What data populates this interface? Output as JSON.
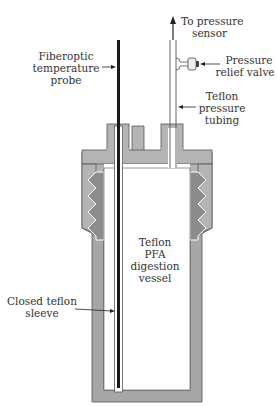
{
  "diagram": {
    "labels": {
      "to_pressure_sensor": [
        "To pressure",
        "sensor"
      ],
      "fiberoptic_probe": [
        "Fiberoptic",
        "temperature",
        "probe"
      ],
      "pressure_relief_valve": [
        "Pressure",
        "relief valve"
      ],
      "teflon_tubing": [
        "Teflon",
        "pressure",
        "tubing"
      ],
      "digestion_vessel": [
        "Teflon",
        "PFA",
        "digestion",
        "vessel"
      ],
      "closed_sleeve": [
        "Closed teflon",
        "sleeve"
      ]
    },
    "colors": {
      "cap_gray": "#b4b4b4",
      "thread_dark": "#8c8c8c",
      "body_gray": "#a6a6a6",
      "outline": "#555555",
      "probe": "#1a1a1a"
    }
  }
}
